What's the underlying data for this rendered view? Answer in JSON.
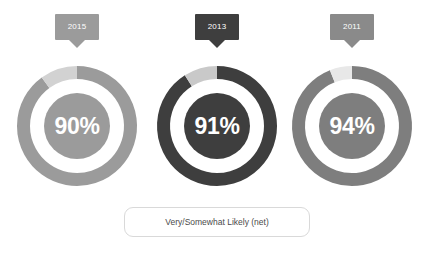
{
  "background_color": "#ffffff",
  "legend": {
    "label": "Very/Somewhat Likely (net)",
    "border_color": "#d9d9d9",
    "text_color": "#4a4a4a",
    "background_color": "#ffffff"
  },
  "donuts": [
    {
      "year": "2015",
      "value_label": "90%",
      "value": 90,
      "remainder": 10,
      "ring_color": "#9b9b9b",
      "remainder_color": "#d2d2d2",
      "center_fill": "#9b9b9b",
      "center_text_color": "#ffffff",
      "tag_color": "#9b9b9b",
      "tag_text_color": "#ffffff",
      "cx": 77,
      "cy": 126
    },
    {
      "year": "2013",
      "value_label": "91%",
      "value": 91,
      "remainder": 9,
      "ring_color": "#3e3e3e",
      "remainder_color": "#c9c9c9",
      "center_fill": "#3e3e3e",
      "center_text_color": "#ffffff",
      "tag_color": "#3e3e3e",
      "tag_text_color": "#ffffff",
      "cx": 217,
      "cy": 126
    },
    {
      "year": "2011",
      "value_label": "94%",
      "value": 94,
      "remainder": 6,
      "ring_color": "#7e7e7e",
      "remainder_color": "#e8e8e8",
      "center_fill": "#7e7e7e",
      "center_text_color": "#ffffff",
      "tag_color": "#8a8a8a",
      "tag_text_color": "#ffffff",
      "cx": 352,
      "cy": 126
    }
  ],
  "chart_data": {
    "type": "pie",
    "title": "",
    "subtitle": "",
    "xlabel": "",
    "ylabel": "",
    "legend_position": "bottom",
    "grid": false,
    "series_label": "Very/Somewhat Likely (net)",
    "categories": [
      "2015",
      "2013",
      "2011"
    ],
    "values": [
      90,
      91,
      94
    ],
    "value_labels": [
      "90%",
      "91%",
      "94%"
    ],
    "units": "percent",
    "charts": [
      {
        "category": "2015",
        "slices": [
          {
            "name": "Very/Somewhat Likely (net)",
            "value": 90,
            "color": "#9b9b9b"
          },
          {
            "name": "Remainder",
            "value": 10,
            "color": "#d2d2d2"
          }
        ]
      },
      {
        "category": "2013",
        "slices": [
          {
            "name": "Very/Somewhat Likely (net)",
            "value": 91,
            "color": "#3e3e3e"
          },
          {
            "name": "Remainder",
            "value": 9,
            "color": "#c9c9c9"
          }
        ]
      },
      {
        "category": "2011",
        "slices": [
          {
            "name": "Very/Somewhat Likely (net)",
            "value": 94,
            "color": "#7e7e7e"
          },
          {
            "name": "Remainder",
            "value": 6,
            "color": "#e8e8e8"
          }
        ]
      }
    ]
  }
}
